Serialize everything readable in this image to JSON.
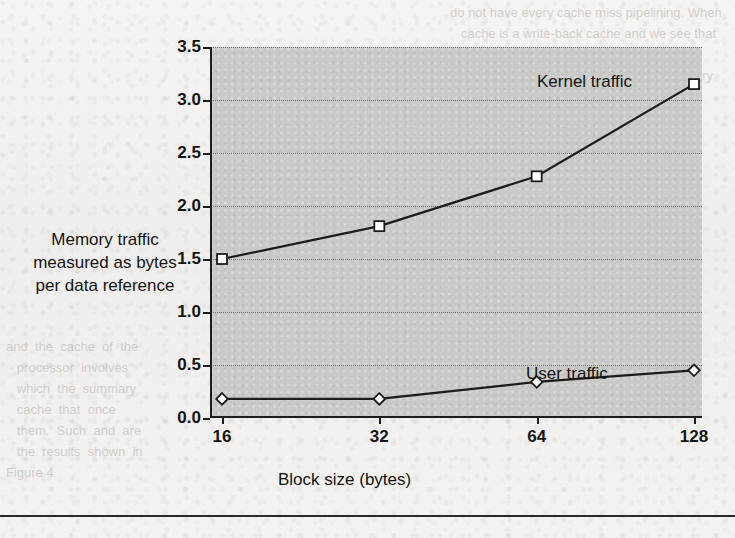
{
  "figure": {
    "yaxis_title_lines": [
      "Memory traffic",
      "measured as bytes",
      "per data reference"
    ],
    "yaxis_title": "Memory traffic measured as bytes per data reference",
    "xaxis_title": "Block size (bytes)",
    "series_labels": {
      "kernel": "Kernel traffic",
      "user": "User traffic"
    },
    "colors": {
      "plot_background": "#c9c9c7",
      "page_background": "#f2f1ef",
      "axis": "#1c1c1c",
      "gridline": "#6f6f6d",
      "line": "#1c1c1c",
      "marker_fill": "#ffffff",
      "text": "#141414"
    }
  },
  "chart_data": {
    "type": "line",
    "title": "",
    "subtitle": "",
    "xlabel": "Block size (bytes)",
    "ylabel": "Memory traffic measured as bytes per data reference",
    "x": [
      16,
      32,
      64,
      128
    ],
    "categories": [
      "16",
      "32",
      "64",
      "128"
    ],
    "xscale": "log2-categorical",
    "xtick_labels": [
      "16",
      "32",
      "64",
      "128"
    ],
    "ylim": [
      0.0,
      3.5
    ],
    "ytick_labels": [
      "0.0",
      "0.5",
      "1.0",
      "1.5",
      "2.0",
      "2.5",
      "3.0",
      "3.5"
    ],
    "yticks": [
      0.0,
      0.5,
      1.0,
      1.5,
      2.0,
      2.5,
      3.0,
      3.5
    ],
    "grid": "horizontal-dotted",
    "legend_position": "inline-annotations",
    "series": [
      {
        "name": "Kernel traffic",
        "marker": "square-open",
        "values": [
          1.5,
          1.81,
          2.28,
          3.15
        ]
      },
      {
        "name": "User traffic",
        "marker": "diamond-open",
        "values": [
          0.18,
          0.18,
          0.34,
          0.45
        ]
      }
    ],
    "annotations": [
      {
        "text": "Kernel traffic",
        "x": 128,
        "y": 3.22
      },
      {
        "text": "User traffic",
        "x": 110,
        "y": 0.62
      }
    ]
  },
  "bleed_through": {
    "right": "     do not have every cache miss pipelining. When\n        cache is a write-back cache and we see that regi\n        fine-grained  is  not  available,  the  memory  passed\n        a  block  is  write-back  as  well.\n        miss penalties, and  we  ask  why\n        a better alternative is to use a large  and\n        memory reference that this is using the\n        processor must and the overhead of",
    "left": "and  the  cache  of  the\n   processor  involves\n   which  the  summary\n   cache  that  once\n   them.  Such  and  are\n   the  results  shown  in  Figure 4"
  }
}
